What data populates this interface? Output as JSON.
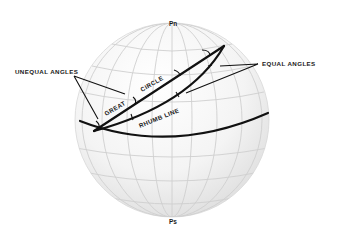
{
  "diagram": {
    "labels": {
      "north_pole": "Pn",
      "south_pole": "Ps",
      "unequal_angles": "UNEQUAL ANGLES",
      "equal_angles": "EQUAL ANGLES",
      "great": "GREAT",
      "circle": "CIRCLE",
      "rhumb_line": "RHUMB LINE"
    },
    "colors": {
      "background": "#ffffff",
      "sphere_light": "#fbfbfb",
      "sphere_shade": "#e2e2e2",
      "graticule": "#cfcfcf",
      "ink": "#111111"
    }
  }
}
